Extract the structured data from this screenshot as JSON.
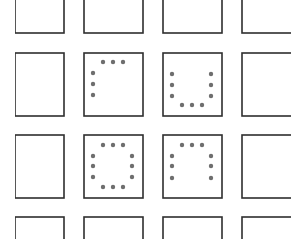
{
  "diagram": {
    "type": "dot-pattern grid",
    "background": "#ffffff",
    "line_color": "#2e2e2e",
    "dot_color": "#6e6e6e",
    "dot_radius": 2.2,
    "columns_x": [
      [
        15,
        64
      ],
      [
        84,
        143
      ],
      [
        163,
        222
      ],
      [
        242,
        292
      ]
    ],
    "rows_y": [
      [
        -10,
        33
      ],
      [
        53,
        116
      ],
      [
        135,
        198
      ],
      [
        217,
        250
      ]
    ],
    "cells": [
      {
        "row": 1,
        "col": 1,
        "label": "top-left-L",
        "dots": [
          [
            103,
            62
          ],
          [
            113,
            62
          ],
          [
            123,
            62
          ],
          [
            93,
            73
          ],
          [
            93,
            84
          ],
          [
            93,
            95
          ]
        ]
      },
      {
        "row": 1,
        "col": 2,
        "label": "U-shape",
        "dots": [
          [
            172,
            74
          ],
          [
            172,
            85
          ],
          [
            172,
            96
          ],
          [
            211,
            74
          ],
          [
            211,
            85
          ],
          [
            211,
            96
          ],
          [
            182,
            105
          ],
          [
            192,
            105
          ],
          [
            202,
            105
          ]
        ]
      },
      {
        "row": 2,
        "col": 1,
        "label": "full-ring",
        "dots": [
          [
            103,
            145
          ],
          [
            113,
            145
          ],
          [
            123,
            145
          ],
          [
            93,
            156
          ],
          [
            93,
            166
          ],
          [
            93,
            177
          ],
          [
            132,
            156
          ],
          [
            132,
            166
          ],
          [
            132,
            177
          ],
          [
            103,
            187
          ],
          [
            113,
            187
          ],
          [
            123,
            187
          ]
        ]
      },
      {
        "row": 2,
        "col": 2,
        "label": "inverted-U",
        "dots": [
          [
            182,
            145
          ],
          [
            192,
            145
          ],
          [
            202,
            145
          ],
          [
            172,
            156
          ],
          [
            172,
            166
          ],
          [
            172,
            178
          ],
          [
            211,
            156
          ],
          [
            211,
            166
          ],
          [
            211,
            178
          ]
        ]
      }
    ]
  }
}
